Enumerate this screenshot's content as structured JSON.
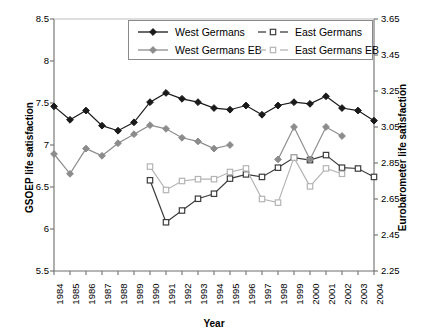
{
  "chart_data": {
    "type": "line",
    "title": "",
    "subtitle": "",
    "xlabel": "Year",
    "ylabel": "GSOEP life satisfaction",
    "ylabel_right": "Eurobarometer life satisfaction",
    "grid": false,
    "legend_position": "top-center",
    "x": [
      1984,
      1985,
      1986,
      1987,
      1988,
      1989,
      1990,
      1991,
      1992,
      1993,
      1994,
      1995,
      1996,
      1997,
      1998,
      1999,
      2000,
      2001,
      2002,
      2003,
      2004
    ],
    "categories": [
      "1984",
      "1985",
      "1986",
      "1987",
      "1988",
      "1989",
      "1990",
      "1991",
      "1992",
      "1993",
      "1994",
      "1995",
      "1996",
      "1997",
      "1998",
      "1999",
      "2000",
      "2001",
      "2002",
      "2003",
      "2004"
    ],
    "ylim": [
      5.5,
      8.5
    ],
    "yticks": [
      "5.5",
      "6",
      "6.5",
      "7",
      "7.5",
      "8",
      "8.5"
    ],
    "ylim_right": [
      2.25,
      3.65
    ],
    "yticks_right": [
      "2.25",
      "2.45",
      "2.65",
      "2.85",
      "3.05",
      "3.25",
      "3.45",
      "3.65"
    ],
    "series": [
      {
        "name": "West Germans",
        "axis": "left",
        "marker": "filled-diamond",
        "color": "#1a1a1a",
        "values": [
          7.46,
          7.3,
          7.41,
          7.23,
          7.17,
          7.27,
          7.51,
          7.62,
          7.55,
          7.51,
          7.44,
          7.42,
          7.47,
          7.36,
          7.47,
          7.51,
          7.49,
          7.58,
          7.44,
          7.41,
          7.29
        ]
      },
      {
        "name": "East Germans",
        "axis": "left",
        "marker": "open-square",
        "color": "#3c3c3c",
        "values": [
          null,
          null,
          null,
          null,
          null,
          null,
          6.58,
          6.08,
          6.22,
          6.36,
          6.42,
          6.6,
          6.65,
          6.62,
          6.73,
          6.85,
          6.82,
          6.88,
          6.73,
          6.72,
          6.62
        ]
      },
      {
        "name": "West Germans EB",
        "axis": "right",
        "marker": "filled-diamond",
        "color": "#8c8c8c",
        "values": [
          2.9,
          2.79,
          2.93,
          2.89,
          2.96,
          3.01,
          3.06,
          3.04,
          2.99,
          2.97,
          2.93,
          2.95,
          null,
          null,
          2.87,
          3.05,
          2.87,
          3.05,
          3.0,
          null,
          null
        ]
      },
      {
        "name": "East Germans EB",
        "axis": "right",
        "marker": "open-square",
        "color": "#b4b4b4",
        "values": [
          null,
          null,
          null,
          null,
          null,
          null,
          2.83,
          2.7,
          2.75,
          2.76,
          2.76,
          2.8,
          2.82,
          2.65,
          2.63,
          2.88,
          2.72,
          2.82,
          2.79,
          null,
          null
        ]
      }
    ]
  },
  "legend": {
    "items": [
      {
        "label": "West Germans",
        "marker": "filled-diamond",
        "color": "#1a1a1a"
      },
      {
        "label": "East Germans",
        "marker": "open-square",
        "color": "#3c3c3c"
      },
      {
        "label": "West Germans EB",
        "marker": "filled-diamond",
        "color": "#8c8c8c"
      },
      {
        "label": "East Germans EB",
        "marker": "open-square",
        "color": "#b4b4b4"
      }
    ]
  },
  "axes": {
    "x_title": "Year",
    "y_left_title": "GSOEP life satisfaction",
    "y_right_title": "Eurobarometer life satisfaction"
  }
}
